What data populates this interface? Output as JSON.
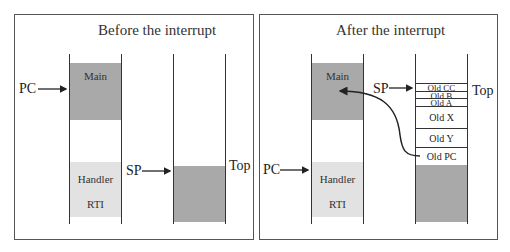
{
  "before": {
    "title": "Before the interrupt",
    "pc_label": "PC",
    "sp_label": "SP",
    "top_label": "Top",
    "memory": {
      "main": "Main",
      "handler": "Handler",
      "rti": "RTI"
    }
  },
  "after": {
    "title": "After the interrupt",
    "pc_label": "PC",
    "sp_label": "SP",
    "top_label": "Top",
    "memory": {
      "main": "Main",
      "handler": "Handler",
      "rti": "RTI"
    },
    "stack": [
      "Old CC",
      "Old B",
      "Old A",
      "Old X",
      "Old Y",
      "Old PC"
    ]
  },
  "colors": {
    "dark_fill": "#a9a9a9",
    "light_fill": "#e2e2e2",
    "line": "#333333"
  }
}
